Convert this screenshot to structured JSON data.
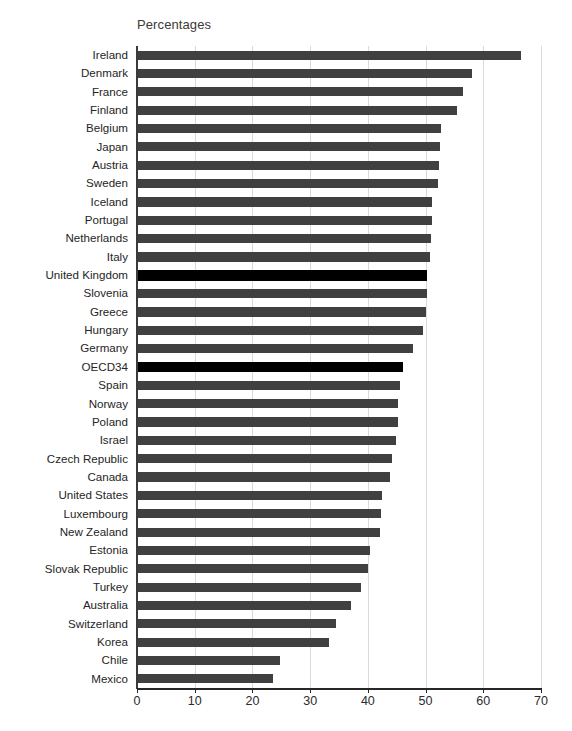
{
  "chart_data": {
    "type": "bar",
    "orientation": "horizontal",
    "title": "Percentages",
    "xlabel": "",
    "ylabel": "",
    "xlim": [
      0,
      70
    ],
    "xticks": [
      0,
      10,
      20,
      30,
      40,
      50,
      60,
      70
    ],
    "grid": true,
    "legend": "none",
    "highlight_color": "#000000",
    "bar_color": "#404040",
    "gridline_color": "#d9d9d9",
    "axis_color": "#262626",
    "categories": [
      "Ireland",
      "Denmark",
      "France",
      "Finland",
      "Belgium",
      "Japan",
      "Austria",
      "Sweden",
      "Iceland",
      "Portugal",
      "Netherlands",
      "Italy",
      "United Kingdom",
      "Slovenia",
      "Greece",
      "Hungary",
      "Germany",
      "OECD34",
      "Spain",
      "Norway",
      "Poland",
      "Israel",
      "Czech Republic",
      "Canada",
      "United States",
      "Luxembourg",
      "New Zealand",
      "Estonia",
      "Slovak Republic",
      "Turkey",
      "Australia",
      "Switzerland",
      "Korea",
      "Chile",
      "Mexico"
    ],
    "values": [
      66.6,
      58.0,
      56.5,
      55.5,
      52.7,
      52.5,
      52.4,
      52.2,
      51.2,
      51.1,
      50.9,
      50.7,
      50.3,
      50.2,
      50.0,
      49.6,
      47.9,
      46.1,
      45.6,
      45.3,
      45.2,
      44.8,
      44.1,
      43.8,
      42.5,
      42.2,
      42.1,
      40.4,
      40.1,
      38.8,
      37.0,
      34.5,
      33.2,
      24.7,
      23.5
    ],
    "highlighted": [
      "United Kingdom",
      "OECD34"
    ]
  },
  "bottom_caption": ""
}
